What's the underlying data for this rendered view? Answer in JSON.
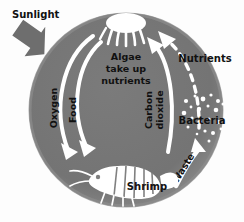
{
  "figure": {
    "background_color": "#fdfdfd",
    "circle_color": "#767676",
    "circle_edge_color": "#8c8c8c",
    "arrow_color": "#ffffff",
    "sunlight_arrow_color": "#6e6e6e",
    "text_color": "#111111"
  },
  "labels": {
    "sunlight": "Sunlight",
    "algae_line1": "Algae",
    "algae_line2": "take up",
    "algae_line3": "nutrients",
    "oxygen": "Oxygen",
    "food": "Food",
    "carbon_dioxide_line1": "Carbon",
    "carbon_dioxide_line2": "dioxide",
    "nutrients": "Nutrients",
    "bacteria": "Bacteria",
    "waste": "Waste",
    "shrimp": "Shrimp"
  },
  "organisms": [
    {
      "name": "algae",
      "label": "Algae take up nutrients"
    },
    {
      "name": "shrimp",
      "label": "Shrimp"
    },
    {
      "name": "bacteria",
      "label": "Bacteria"
    }
  ],
  "flows": [
    {
      "name": "sunlight",
      "label": "Sunlight",
      "from": "outside",
      "to": "algae",
      "style": "solid",
      "color": "#6e6e6e"
    },
    {
      "name": "oxygen",
      "label": "Oxygen",
      "from": "algae",
      "to": "shrimp",
      "style": "solid",
      "color": "#ffffff"
    },
    {
      "name": "food",
      "label": "Food",
      "from": "algae",
      "to": "shrimp",
      "style": "solid",
      "color": "#ffffff"
    },
    {
      "name": "carbon-dioxide",
      "label": "Carbon dioxide",
      "from": "shrimp",
      "to": "algae",
      "style": "solid",
      "color": "#ffffff"
    },
    {
      "name": "waste",
      "label": "Waste",
      "from": "shrimp",
      "to": "bacteria",
      "style": "solid",
      "color": "#ffffff"
    },
    {
      "name": "nutrients",
      "label": "Nutrients",
      "from": "bacteria",
      "to": "algae",
      "style": "dashed",
      "color": "#ffffff"
    }
  ]
}
